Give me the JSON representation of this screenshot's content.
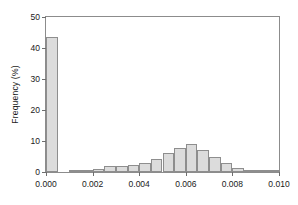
{
  "chart_data": {
    "type": "bar",
    "title": "",
    "subtitle": "",
    "xlabel": "",
    "ylabel": "Frequency (%)",
    "xlim": [
      0.0,
      0.01
    ],
    "ylim": [
      0,
      50
    ],
    "grid": false,
    "legend": null,
    "bin_width": 0.0005,
    "xticks": [
      "0.000",
      "0.002",
      "0.004",
      "0.006",
      "0.008",
      "0.010"
    ],
    "xtick_values": [
      0.0,
      0.002,
      0.004,
      0.006,
      0.008,
      0.01
    ],
    "yticks": [
      "0",
      "10",
      "20",
      "30",
      "40",
      "50"
    ],
    "ytick_values": [
      0,
      10,
      20,
      30,
      40,
      50
    ],
    "bar_fill_color": "#dcdcdc",
    "bar_edge_color": "#8e8e8e",
    "axis_color": "#8c8c8c",
    "bins": [
      {
        "x": 0.0,
        "value": 43.5
      },
      {
        "x": 0.0005,
        "value": 0.0
      },
      {
        "x": 0.001,
        "value": 0.2
      },
      {
        "x": 0.0015,
        "value": 0.3
      },
      {
        "x": 0.002,
        "value": 1.1
      },
      {
        "x": 0.0025,
        "value": 2.1
      },
      {
        "x": 0.003,
        "value": 1.8
      },
      {
        "x": 0.0035,
        "value": 2.2
      },
      {
        "x": 0.004,
        "value": 3.0
      },
      {
        "x": 0.0045,
        "value": 4.3
      },
      {
        "x": 0.005,
        "value": 6.2
      },
      {
        "x": 0.0055,
        "value": 7.8
      },
      {
        "x": 0.006,
        "value": 9.0
      },
      {
        "x": 0.0065,
        "value": 7.0
      },
      {
        "x": 0.007,
        "value": 5.0
      },
      {
        "x": 0.0075,
        "value": 2.9
      },
      {
        "x": 0.008,
        "value": 1.4
      },
      {
        "x": 0.0085,
        "value": 0.7
      },
      {
        "x": 0.009,
        "value": 0.2
      },
      {
        "x": 0.0095,
        "value": 0.1
      }
    ]
  }
}
